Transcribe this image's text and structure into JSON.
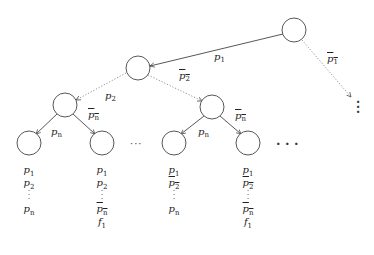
{
  "diagram": {
    "type": "binary-decision-tree",
    "nodes": [
      {
        "id": "root",
        "x": 294,
        "y": 30
      },
      {
        "id": "n1",
        "x": 138,
        "y": 68
      },
      {
        "id": "n2L",
        "x": 65,
        "y": 105
      },
      {
        "id": "n2R",
        "x": 212,
        "y": 107
      },
      {
        "id": "leafLL",
        "x": 29,
        "y": 143
      },
      {
        "id": "leafLR",
        "x": 102,
        "y": 143
      },
      {
        "id": "leafRL",
        "x": 174,
        "y": 143
      },
      {
        "id": "leafRR",
        "x": 248,
        "y": 143
      }
    ],
    "edges": [
      {
        "from": "root",
        "to": "n1",
        "label": "p1",
        "style": "solid"
      },
      {
        "from": "root",
        "to": "more",
        "label": "¬p1",
        "style": "dotted"
      },
      {
        "from": "n1",
        "to": "n2L",
        "label": "p2",
        "style": "dotted"
      },
      {
        "from": "n1",
        "to": "n2R",
        "label": "¬p2",
        "style": "dotted"
      },
      {
        "from": "n2L",
        "to": "leafLL",
        "label": "pn",
        "style": "solid"
      },
      {
        "from": "n2L",
        "to": "leafLR",
        "label": "¬pn",
        "style": "solid"
      },
      {
        "from": "n2R",
        "to": "leafRL",
        "label": "pn",
        "style": "solid"
      },
      {
        "from": "n2R",
        "to": "leafRR",
        "label": "¬pn",
        "style": "solid"
      }
    ],
    "ellipsis_mid": "···",
    "ellipsis_right": "· · ·",
    "leaf_columns": [
      [
        "p1",
        "p2",
        "⋮",
        "pn"
      ],
      [
        "p1",
        "p2",
        "⋮",
        "¬pn",
        "f1"
      ],
      [
        "p1",
        "¬p2",
        "⋮",
        "pn"
      ],
      [
        "p1",
        "¬p2",
        "⋮",
        "¬pn",
        "f1"
      ]
    ]
  },
  "labels": {
    "p": "p",
    "s1": "1",
    "s2": "2",
    "sn": "n",
    "f": "f"
  }
}
